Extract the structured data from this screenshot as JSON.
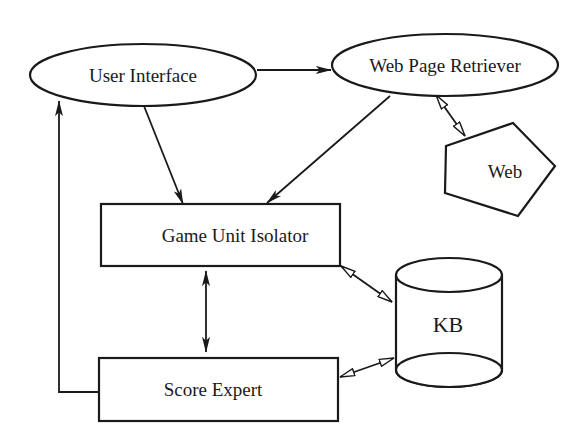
{
  "diagram": {
    "type": "system-architecture",
    "nodes": [
      {
        "id": "user_interface",
        "label": "User Interface",
        "shape": "ellipse"
      },
      {
        "id": "web_page_retriever",
        "label": "Web Page Retriever",
        "shape": "ellipse"
      },
      {
        "id": "web",
        "label": "Web",
        "shape": "pentagon"
      },
      {
        "id": "game_unit_isolator",
        "label": "Game Unit Isolator",
        "shape": "rectangle"
      },
      {
        "id": "score_expert",
        "label": "Score Expert",
        "shape": "rectangle"
      },
      {
        "id": "kb",
        "label": "KB",
        "shape": "cylinder"
      }
    ],
    "edges": [
      {
        "from": "user_interface",
        "to": "web_page_retriever",
        "style": "solid-arrow"
      },
      {
        "from": "user_interface",
        "to": "game_unit_isolator",
        "style": "solid-arrow"
      },
      {
        "from": "web_page_retriever",
        "to": "game_unit_isolator",
        "style": "solid-arrow"
      },
      {
        "from": "web_page_retriever",
        "to": "web",
        "style": "hollow-double-arrow"
      },
      {
        "from": "game_unit_isolator",
        "to": "score_expert",
        "style": "solid-double-arrow"
      },
      {
        "from": "game_unit_isolator",
        "to": "kb",
        "style": "hollow-double-arrow"
      },
      {
        "from": "score_expert",
        "to": "kb",
        "style": "hollow-double-arrow"
      },
      {
        "from": "score_expert",
        "to": "user_interface",
        "style": "solid-arrow-elbow"
      }
    ],
    "colors": {
      "stroke": "#1a1a1a",
      "background": "#ffffff"
    }
  }
}
